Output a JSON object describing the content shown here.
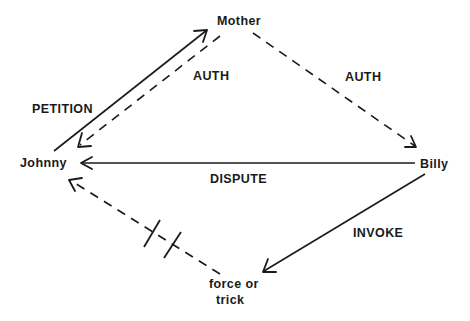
{
  "diagram": {
    "type": "relationship-diagram",
    "nodes": [
      {
        "id": "mother",
        "label": "Mother"
      },
      {
        "id": "johnny",
        "label": "Johnny"
      },
      {
        "id": "billy",
        "label": "Billy"
      },
      {
        "id": "force",
        "label_line1": "force or",
        "label_line2": "trick"
      }
    ],
    "edges": [
      {
        "id": "petition",
        "from": "johnny",
        "to": "mother",
        "label": "PETITION",
        "style": "solid"
      },
      {
        "id": "auth-johnny",
        "from": "mother",
        "to": "johnny",
        "label": "AUTH",
        "style": "dashed"
      },
      {
        "id": "auth-billy",
        "from": "mother",
        "to": "billy",
        "label": "AUTH",
        "style": "dashed"
      },
      {
        "id": "dispute",
        "from": "billy",
        "to": "johnny",
        "label": "DISPUTE",
        "style": "solid"
      },
      {
        "id": "invoke",
        "from": "billy",
        "to": "force",
        "label": "INVOKE",
        "style": "solid"
      },
      {
        "id": "blocked",
        "from": "force",
        "to": "johnny",
        "label": "",
        "style": "dashed",
        "blocked": true
      }
    ]
  }
}
